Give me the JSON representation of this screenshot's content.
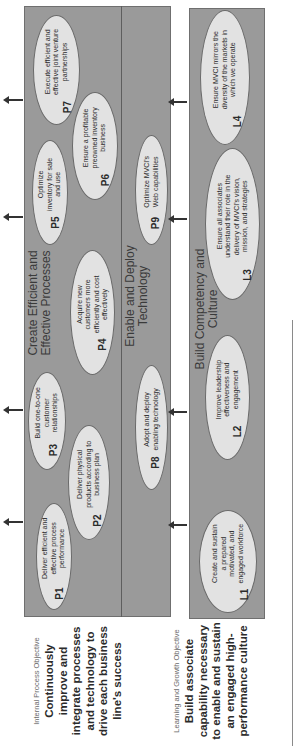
{
  "internal_process": {
    "objective_label": "Internal Process Objective",
    "objective_text": "Continuously improve and integrate processes and technology to drive each business line's success",
    "processes_group": {
      "title": "Create Efficient and Effective Processes",
      "items": [
        {
          "code": "P1",
          "text": "Deliver efficient and effective process performance"
        },
        {
          "code": "P2",
          "text": "Deliver physical products according to business plan"
        },
        {
          "code": "P3",
          "text": "Build one-to-one customer relationships"
        },
        {
          "code": "P4",
          "text": "Acquire new customers more efficiently and cost effectively"
        },
        {
          "code": "P5",
          "text": "Optimize inventory for sale and use"
        },
        {
          "code": "P6",
          "text": "Ensure a profitable preowned inventory business"
        },
        {
          "code": "P7",
          "text": "Execute efficient and effective joint venture partnerships"
        }
      ]
    },
    "technology_group": {
      "title": "Enable and Deploy Technology",
      "items": [
        {
          "code": "P8",
          "text": "Adopt and deploy enabling technology"
        },
        {
          "code": "P9",
          "text": "Optimize MVCI's Web capabilities"
        }
      ]
    }
  },
  "learning_growth": {
    "objective_label": "Learning and Growth Objective",
    "objective_text": "Build associate capability necessary to enable and sustain an engaged high-performance culture",
    "group": {
      "title": "Build Competency and Culture",
      "items": [
        {
          "code": "L1",
          "text": "Create and sustain a prepared motivated, and engaged workforce"
        },
        {
          "code": "L2",
          "text": "Improve leadership effectiveness and engagement"
        },
        {
          "code": "L3",
          "text": "Ensure all associates understand their role in the delivery of MVCI's vision, mission, and strategies"
        },
        {
          "code": "L4",
          "text": "Ensure MVCI mirrors the diversity of the markets in which we operate"
        }
      ]
    }
  },
  "colors": {
    "box_fill": "#9a9a9a",
    "ellipse_fill": "#e2e2e2",
    "text": "#2b2b2b"
  }
}
